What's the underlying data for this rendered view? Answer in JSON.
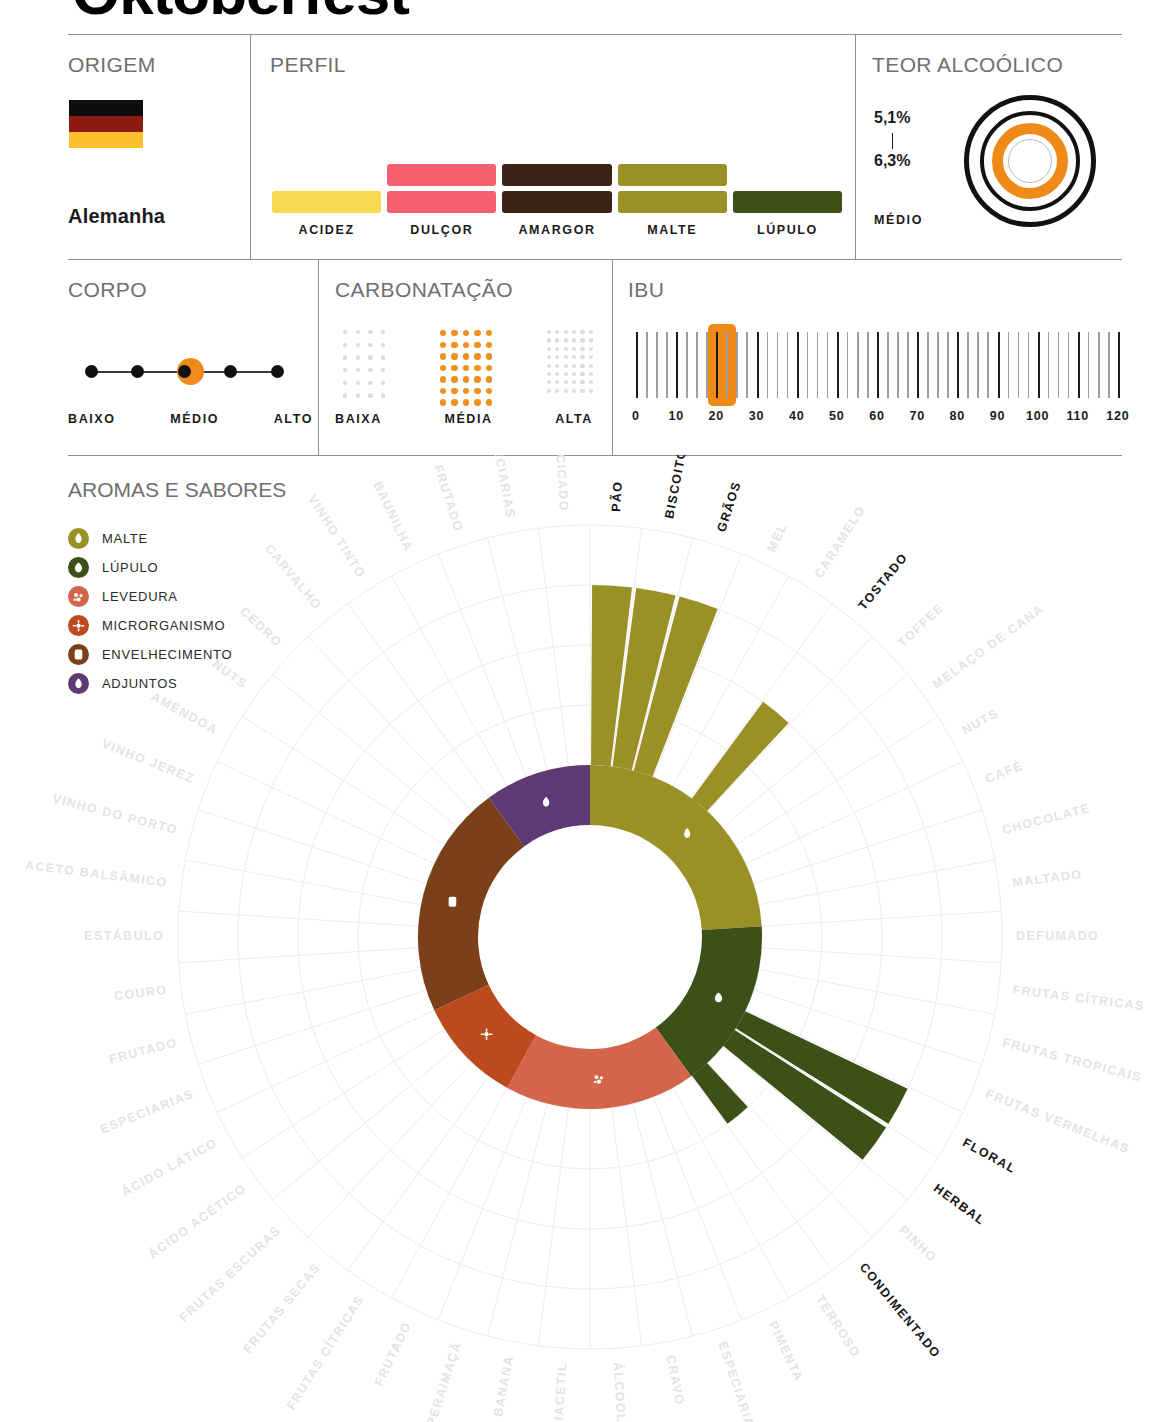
{
  "header": {
    "title": "Oktoberfest"
  },
  "origem": {
    "title": "ORIGEM",
    "country": "Alemanha",
    "flag_colors": [
      "#0d0d0d",
      "#8c1b13",
      "#fbc02d"
    ]
  },
  "perfil": {
    "title": "PERFIL",
    "items": [
      {
        "label": "ACIDEZ",
        "level": 1,
        "color": "#f7d84f"
      },
      {
        "label": "DULÇOR",
        "level": 2,
        "color": "#f7606e"
      },
      {
        "label": "AMARGOR",
        "level": 2,
        "color": "#3d2316"
      },
      {
        "label": "MALTE",
        "level": 2,
        "color": "#9a9126"
      },
      {
        "label": "LÚPULO",
        "level": 1,
        "color": "#3d5018"
      }
    ]
  },
  "teor_alcoolico": {
    "title": "TEOR ALCOÓLICO",
    "min": "5,1%",
    "max": "6,3%",
    "level_label": "MÉDIO",
    "active_ring": 3,
    "accent": "#ef8a18"
  },
  "corpo": {
    "title": "CORPO",
    "dots": 5,
    "active_index": 3,
    "labels": [
      "BAIXO",
      "MÉDIO",
      "ALTO"
    ],
    "accent": "#f08a1c"
  },
  "carbonatacao": {
    "title": "CARBONATAÇÃO",
    "options": [
      {
        "label": "BAIXA",
        "cols": 4,
        "rows": 6,
        "active": false
      },
      {
        "label": "MÉDIA",
        "cols": 5,
        "rows": 7,
        "active": true
      },
      {
        "label": "ALTA",
        "cols": 6,
        "rows": 8,
        "active": false
      }
    ],
    "accent": "#f0901f",
    "inactive_color": "#dcdcdc"
  },
  "ibu": {
    "title": "IBU",
    "ticks": [
      "0",
      "10",
      "20",
      "30",
      "40",
      "50",
      "60",
      "70",
      "80",
      "90",
      "100",
      "110",
      "120"
    ],
    "min": 0,
    "max": 120,
    "highlight_from": 18,
    "highlight_to": 25,
    "accent": "#ef8a18"
  },
  "aromas": {
    "title": "AROMAS E SABORES",
    "legend": [
      {
        "label": "MALTE",
        "color": "#9a9126",
        "icon": "malt-icon"
      },
      {
        "label": "LÚPULO",
        "color": "#3d5018",
        "icon": "hop-icon"
      },
      {
        "label": "LEVEDURA",
        "color": "#d3654a",
        "icon": "yeast-icon"
      },
      {
        "label": "MICRORGANISMO",
        "color": "#bc4a1e",
        "icon": "microorganism-icon"
      },
      {
        "label": "ENVELHECIMENTO",
        "color": "#7b3f19",
        "icon": "barrel-icon"
      },
      {
        "label": "ADJUNTOS",
        "color": "#5d3a73",
        "icon": "adjunct-icon"
      }
    ]
  },
  "chart_data": {
    "type": "pie",
    "title": "AROMAS E SABORES",
    "legend_position": "left",
    "rings": 4,
    "categories": [
      {
        "name": "MALTE",
        "color": "#9a9126",
        "icon": "malt-icon",
        "flavors": [
          "PÃO",
          "BISCOITO",
          "GRÃOS",
          "MEL",
          "CARAMELO",
          "TOSTADO",
          "TOFFEE",
          "MELAÇO DE CANA",
          "NUTS",
          "CAFÉ",
          "CHOCOLATE",
          "MALTADO"
        ],
        "active": {
          "PÃO": 3,
          "BISCOITO": 3,
          "GRÃOS": 3,
          "TOSTADO": 2
        }
      },
      {
        "name": "LÚPULO",
        "color": "#3d5018",
        "icon": "hop-icon",
        "flavors": [
          "DEFUMADO",
          "FRUTAS CÍTRICAS",
          "FRUTAS TROPICAIS",
          "FRUTAS VERMELHAS",
          "FLORAL",
          "HERBAL",
          "PINHO",
          "CONDIMENTADO"
        ],
        "active": {
          "FLORAL": 3,
          "HERBAL": 3,
          "CONDIMENTADO": 1
        }
      },
      {
        "name": "LEVEDURA",
        "color": "#d3654a",
        "icon": "yeast-icon",
        "flavors": [
          "TERROSO",
          "PIMENTA",
          "ESPECIARIAS",
          "CRAVO",
          "ÁLCOOL",
          "DIACETIL",
          "BANANA",
          "PERA/MAÇÃ",
          "FRUTADO"
        ],
        "active": {}
      },
      {
        "name": "MICRORGANISMO",
        "color": "#bc4a1e",
        "icon": "microorganism-icon",
        "flavors": [
          "FRUTAS CÍTRICAS",
          "FRUTAS SECAS",
          "FRUTAS ESCURAS",
          "ÁCIDO ACÉTICO",
          "ÁCIDO LÁTICO"
        ],
        "active": {}
      },
      {
        "name": "ENVELHECIMENTO",
        "color": "#7b3f19",
        "icon": "barrel-icon",
        "flavors": [
          "ESPECIARIAS",
          "FRUTADO",
          "COURO",
          "ESTÁBULO",
          "ACETO BALSÂMICO",
          "VINHO DO PORTO",
          "VINHO JEREZ",
          "AMÊNDOA",
          "NUTS",
          "CEDRO",
          "CARVALHO"
        ],
        "active": {}
      },
      {
        "name": "ADJUNTOS",
        "color": "#5d3a73",
        "icon": "adjunct-icon",
        "flavors": [
          "VINHO TINTO",
          "BAUNILHA",
          "FRUTADO",
          "ESPECIARIAS",
          "ADOCICADO"
        ],
        "active": {}
      }
    ],
    "wheel_labels": [
      {
        "text": "PÃO",
        "on": true
      },
      {
        "text": "BISCOITO",
        "on": true
      },
      {
        "text": "GRÃOS",
        "on": true
      },
      {
        "text": "MEL",
        "on": false
      },
      {
        "text": "CARAMELO",
        "on": false
      },
      {
        "text": "TOSTADO",
        "on": true
      },
      {
        "text": "TOFFEE",
        "on": false
      },
      {
        "text": "MELAÇO DE CANA",
        "on": false
      },
      {
        "text": "NUTS",
        "on": false
      },
      {
        "text": "CAFÉ",
        "on": false
      },
      {
        "text": "CHOCOLATE",
        "on": false
      },
      {
        "text": "MALTADO",
        "on": false
      },
      {
        "text": "DEFUMADO",
        "on": false
      },
      {
        "text": "FRUTAS CÍTRICAS",
        "on": false
      },
      {
        "text": "FRUTAS TROPICAIS",
        "on": false
      },
      {
        "text": "FRUTAS VERMELHAS",
        "on": false
      },
      {
        "text": "FLORAL",
        "on": true
      },
      {
        "text": "HERBAL",
        "on": true
      },
      {
        "text": "PINHO",
        "on": false
      },
      {
        "text": "CONDIMENTADO",
        "on": true
      },
      {
        "text": "TERROSO",
        "on": false
      },
      {
        "text": "PIMENTA",
        "on": false
      },
      {
        "text": "ESPECIARIAS",
        "on": false
      },
      {
        "text": "CRAVO",
        "on": false
      },
      {
        "text": "ÁLCOOL",
        "on": false
      },
      {
        "text": "DIACETIL",
        "on": false
      },
      {
        "text": "BANANA",
        "on": false
      },
      {
        "text": "PERA/MAÇÃ",
        "on": false
      },
      {
        "text": "FRUTADO",
        "on": false
      },
      {
        "text": "FRUTAS CÍTRICAS",
        "on": false
      },
      {
        "text": "FRUTAS SECAS",
        "on": false
      },
      {
        "text": "FRUTAS ESCURAS",
        "on": false
      },
      {
        "text": "ÁCIDO ACÉTICO",
        "on": false
      },
      {
        "text": "ÁCIDO LÁTICO",
        "on": false
      },
      {
        "text": "ESPECIARIAS",
        "on": false
      },
      {
        "text": "FRUTADO",
        "on": false
      },
      {
        "text": "COURO",
        "on": false
      },
      {
        "text": "ESTÁBULO",
        "on": false
      },
      {
        "text": "ACETO BALSÂMICO",
        "on": false
      },
      {
        "text": "VINHO DO PORTO",
        "on": false
      },
      {
        "text": "VINHO JEREZ",
        "on": false
      },
      {
        "text": "AMÊNDOA",
        "on": false
      },
      {
        "text": "NUTS",
        "on": false
      },
      {
        "text": "CEDRO",
        "on": false
      },
      {
        "text": "CARVALHO",
        "on": false
      },
      {
        "text": "VINHO TINTO",
        "on": false
      },
      {
        "text": "BAUNILHA",
        "on": false
      },
      {
        "text": "FRUTADO",
        "on": false
      },
      {
        "text": "ESPECIARIAS",
        "on": false
      },
      {
        "text": "ADOCICADO",
        "on": false
      }
    ]
  }
}
